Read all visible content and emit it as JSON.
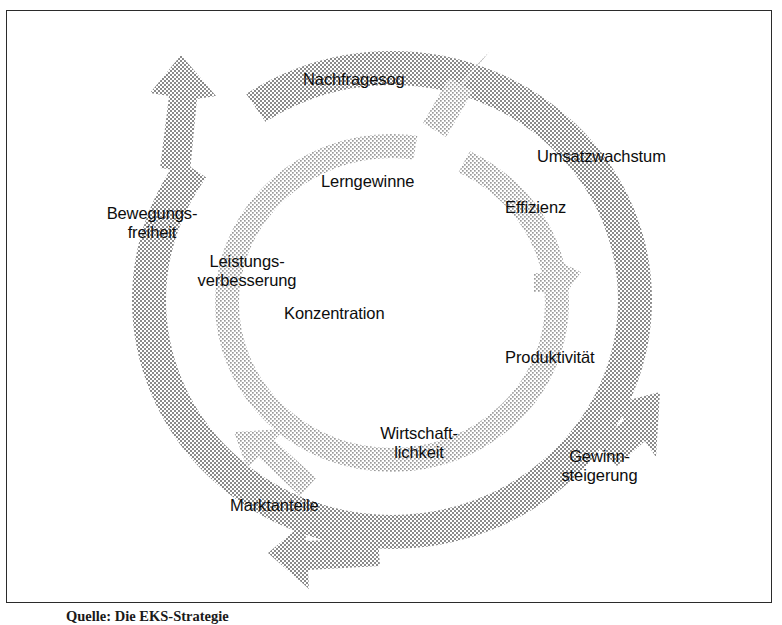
{
  "figure": {
    "kind": "virtuous-cycle-diagram",
    "frame_border_color": "#2b2b2b",
    "background_color": "#ffffff",
    "arrow_fill_color": "#808080",
    "arrow_texture": "halftone-dots",
    "text_color": "#0d0d0d",
    "caption": "Quelle: Die EKS-Strategie"
  },
  "outer_cycle": {
    "name": "outer-arrow-ring",
    "labels": [
      {
        "id": "nachfragesog",
        "text": "Nachfragesog"
      },
      {
        "id": "umsatzwachstum",
        "text": "Umsatzwachstum"
      },
      {
        "id": "produktivitaet",
        "text": "Produktivität"
      },
      {
        "id": "gewinnsteigerung",
        "line1": "Gewinn-",
        "line2": "steigerung"
      },
      {
        "id": "marktanteile",
        "text": "Marktanteile"
      },
      {
        "id": "bewegungsfreiheit",
        "line1": "Bewegungs-",
        "line2": "freiheit"
      }
    ]
  },
  "inner_cycle": {
    "name": "inner-arrow-ring",
    "labels": [
      {
        "id": "lerngewinne",
        "text": "Lerngewinne"
      },
      {
        "id": "effizienz",
        "text": "Effizienz"
      },
      {
        "id": "wirtschaftlichkeit",
        "line1": "Wirtschaft-",
        "line2": "lichkeit"
      },
      {
        "id": "konzentration",
        "text": "Konzentration"
      },
      {
        "id": "leistungsverbesserung",
        "line1": "Leistungs-",
        "line2": "verbesserung"
      }
    ]
  },
  "labels": {
    "nachfragesog": "Nachfragesog",
    "umsatzwachstum": "Umsatzwachstum",
    "effizienz": "Effizienz",
    "lerngewinne": "Lerngewinne",
    "bewegungsfreiheit_1": "Bewegungs-",
    "bewegungsfreiheit_2": "freiheit",
    "leistungsverbesserung_1": "Leistungs-",
    "leistungsverbesserung_2": "verbesserung",
    "konzentration": "Konzentration",
    "produktivitaet": "Produktivität",
    "wirtschaftlichkeit_1": "Wirtschaft-",
    "wirtschaftlichkeit_2": "lichkeit",
    "gewinnsteigerung_1": "Gewinn-",
    "gewinnsteigerung_2": "steigerung",
    "marktanteile": "Marktanteile"
  },
  "caption": {
    "text": "Quelle: Die EKS-Strategie"
  }
}
